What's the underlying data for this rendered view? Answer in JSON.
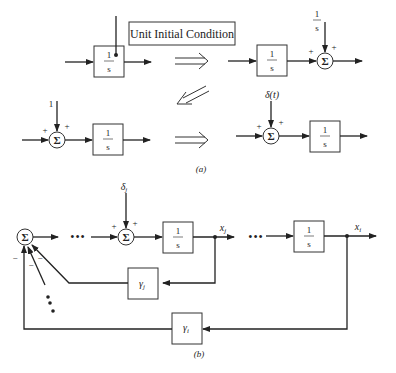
{
  "part_a": {
    "caption": "(a)",
    "annotation": "Unit Initial Condition",
    "integrator_numerator": "1",
    "integrator_denominator": "s",
    "top_right_input": {
      "num": "1",
      "den": "s"
    },
    "bottom_left_input": "1",
    "bottom_right_input": "δ(t)",
    "sum_symbol": "Σ",
    "plus": "+",
    "equivalence_arrows": [
      "⟹",
      "⟸",
      "⟹"
    ]
  },
  "part_b": {
    "caption": "(b)",
    "sum_symbol": "Σ",
    "integrator_numerator": "1",
    "integrator_denominator": "s",
    "input_label": "δj",
    "input_label_base": "δ",
    "input_label_sub": "j",
    "state_j": {
      "base": "x",
      "sub": "j"
    },
    "state_i": {
      "base": "x",
      "sub": "i"
    },
    "gain_j": {
      "base": "γ",
      "sub": "j"
    },
    "gain_i": {
      "base": "γ",
      "sub": "i"
    },
    "plus": "+",
    "minus": "−",
    "ellipsis": "•••"
  }
}
